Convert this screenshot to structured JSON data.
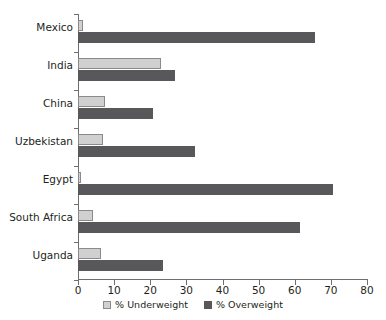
{
  "chart_data": {
    "type": "bar",
    "orientation": "horizontal",
    "title": "",
    "xlabel": "",
    "ylabel": "",
    "xlim": [
      0,
      80
    ],
    "xticks": [
      0,
      10,
      20,
      30,
      40,
      50,
      60,
      70,
      80
    ],
    "grid": false,
    "legend_position": "bottom-center",
    "categories": [
      "Mexico",
      "India",
      "China",
      "Uzbekistan",
      "Egypt",
      "South Africa",
      "Uganda"
    ],
    "series": [
      {
        "name": "% Underweight",
        "color": "#d0d0d0",
        "values": [
          1.5,
          23.0,
          7.5,
          7.0,
          0.8,
          4.2,
          6.4
        ]
      },
      {
        "name": "% Overweight",
        "color": "#58585a",
        "values": [
          65.5,
          26.9,
          20.8,
          32.4,
          70.6,
          61.5,
          23.5
        ]
      }
    ]
  },
  "legend": {
    "items": [
      {
        "label": "% Underweight",
        "swatch": "light-gray-square"
      },
      {
        "label": "% Overweight",
        "swatch": "dark-gray-square"
      }
    ]
  },
  "axis": {
    "x_tick_labels": [
      "0",
      "10",
      "20",
      "30",
      "40",
      "50",
      "60",
      "70",
      "80"
    ]
  }
}
